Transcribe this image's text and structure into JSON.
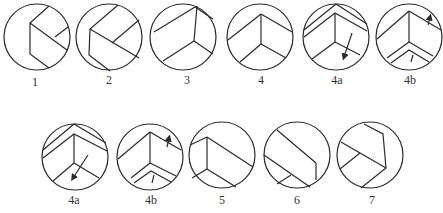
{
  "figure": {
    "type": "sequence of circular cross-section sketches",
    "rows": [
      {
        "panels": [
          {
            "label": "1",
            "cx": 37,
            "cy": 37
          },
          {
            "label": "2",
            "cx": 109,
            "cy": 37
          },
          {
            "label": "3",
            "cx": 183,
            "cy": 37
          },
          {
            "label": "4",
            "cx": 260,
            "cy": 37
          },
          {
            "label": "4a",
            "cx": 336,
            "cy": 37
          },
          {
            "label": "4b",
            "cx": 409,
            "cy": 37
          }
        ]
      },
      {
        "panels": [
          {
            "label": "4a",
            "cx": 75,
            "cy": 157
          },
          {
            "label": "4b",
            "cx": 150,
            "cy": 157
          },
          {
            "label": "5",
            "cx": 222,
            "cy": 155
          },
          {
            "label": "6",
            "cx": 297,
            "cy": 155
          },
          {
            "label": "7",
            "cx": 370,
            "cy": 155
          }
        ]
      }
    ],
    "radius": 33,
    "stroke_color": "#2a2a2a"
  },
  "labels": {
    "p1": "1",
    "p2": "2",
    "p3": "3",
    "p4": "4",
    "p4a_top": "4a",
    "p4b_top": "4b",
    "p4a_bottom": "4a",
    "p4b_bottom": "4b",
    "p5": "5",
    "p6": "6",
    "p7": "7"
  }
}
